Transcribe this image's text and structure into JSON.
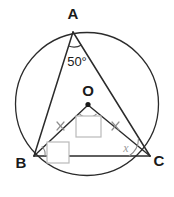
{
  "figure": {
    "background_color": "#ffffff",
    "line_color": "#2b2b2b",
    "marking_color": "#8f8f8f",
    "answer_box_color": "#b9b9b9"
  },
  "labels": {
    "vertex_a": "A",
    "vertex_b": "B",
    "vertex_c": "C",
    "center_o": "O",
    "angle_at_a": "50°",
    "angle_at_c": "x"
  },
  "answer_boxes": {
    "angle_at_o": "",
    "angle_at_b": ""
  },
  "markings": {
    "equal_sides": [
      "OB",
      "OC"
    ],
    "tick_symbol": "x",
    "tick_count": 1,
    "angle_arcs": [
      "A",
      "O",
      "B",
      "C"
    ]
  },
  "geometry": {
    "circle_center_x": 87,
    "circle_center_y": 104,
    "circle_radius": 72,
    "point_a_x": 73,
    "point_a_y": 32,
    "point_b_x": 34,
    "point_b_y": 156,
    "point_c_x": 150,
    "point_c_y": 156,
    "center_x": 88,
    "center_y": 104
  }
}
